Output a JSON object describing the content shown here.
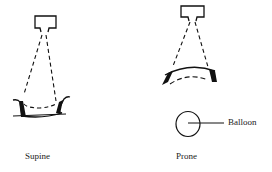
{
  "figure": {
    "panels": [
      {
        "id": "supine",
        "caption": "Supine",
        "elements": [
          "source-box",
          "beam-dashed-lines",
          "curved-support-surface",
          "dashed-chord"
        ]
      },
      {
        "id": "prone",
        "caption": "Prone",
        "elements": [
          "source-box",
          "beam-dashed-lines",
          "arched-support-surface",
          "dashed-arc",
          "balloon-circle"
        ]
      }
    ],
    "annotations": {
      "balloon_label": "Balloon"
    },
    "colors": {
      "stroke": "#111111",
      "text": "#222222",
      "background": "#ffffff"
    }
  }
}
